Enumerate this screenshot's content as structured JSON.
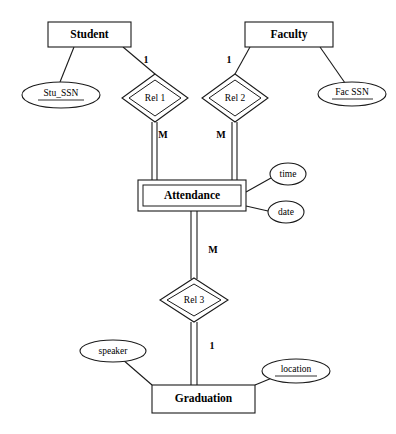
{
  "diagram": {
    "type": "entity-relationship-diagram",
    "notation": "Chen",
    "entities": [
      {
        "id": "student",
        "label": "Student",
        "kind": "strong",
        "x": 48,
        "y": 22,
        "w": 83,
        "h": 25
      },
      {
        "id": "faculty",
        "label": "Faculty",
        "kind": "strong",
        "x": 245,
        "y": 22,
        "w": 88,
        "h": 25
      },
      {
        "id": "attendance",
        "label": "Attendance",
        "kind": "weak",
        "x": 138,
        "y": 180,
        "w": 108,
        "h": 31
      },
      {
        "id": "graduation",
        "label": "Graduation",
        "kind": "strong",
        "x": 152,
        "y": 385,
        "w": 103,
        "h": 28
      }
    ],
    "relationships": [
      {
        "id": "rel1",
        "label": "Rel 1",
        "kind": "identifying",
        "cx": 155,
        "cy": 98,
        "rx": 33,
        "ry": 24
      },
      {
        "id": "rel2",
        "label": "Rel 2",
        "kind": "identifying",
        "cx": 235,
        "cy": 98,
        "rx": 33,
        "ry": 24
      },
      {
        "id": "rel3",
        "label": "Rel 3",
        "kind": "identifying",
        "cx": 194,
        "cy": 300,
        "rx": 34,
        "ry": 22
      }
    ],
    "attributes": [
      {
        "id": "stu_ssn",
        "label": "Stu_SSN",
        "key": true,
        "cx": 61,
        "cy": 95,
        "rx": 39,
        "ry": 13
      },
      {
        "id": "fac_ssn",
        "label": "Fac SSN",
        "key": true,
        "cx": 352,
        "cy": 94,
        "rx": 34,
        "ry": 12
      },
      {
        "id": "time",
        "label": "time",
        "key": false,
        "cx": 288,
        "cy": 174,
        "rx": 18,
        "ry": 11
      },
      {
        "id": "date",
        "label": "date",
        "key": false,
        "cx": 286,
        "cy": 212,
        "rx": 18,
        "ry": 11
      },
      {
        "id": "speaker",
        "label": "speaker",
        "key": false,
        "cx": 113,
        "cy": 351,
        "rx": 33,
        "ry": 11
      },
      {
        "id": "location",
        "label": "location",
        "key": true,
        "cx": 296,
        "cy": 371,
        "rx": 34,
        "ry": 12
      }
    ],
    "cardinalities": [
      {
        "id": "card-student-rel1",
        "label": "1",
        "x": 146,
        "y": 61
      },
      {
        "id": "card-faculty-rel2",
        "label": "1",
        "x": 229,
        "y": 61
      },
      {
        "id": "card-rel1-attendance",
        "label": "M",
        "x": 163,
        "y": 136
      },
      {
        "id": "card-rel2-attendance",
        "label": "M",
        "x": 221,
        "y": 136
      },
      {
        "id": "card-attendance-rel3",
        "label": "M",
        "x": 213,
        "y": 251
      },
      {
        "id": "card-rel3-graduation",
        "label": "1",
        "x": 212,
        "y": 347
      }
    ],
    "connectors": [
      {
        "id": "conn-student-stu_ssn",
        "kind": "single"
      },
      {
        "id": "conn-student-rel1",
        "kind": "single"
      },
      {
        "id": "conn-faculty-rel2",
        "kind": "single"
      },
      {
        "id": "conn-faculty-fac_ssn",
        "kind": "single"
      },
      {
        "id": "conn-rel1-attendance",
        "kind": "double"
      },
      {
        "id": "conn-rel2-attendance",
        "kind": "double"
      },
      {
        "id": "conn-attendance-time",
        "kind": "single"
      },
      {
        "id": "conn-attendance-date",
        "kind": "single"
      },
      {
        "id": "conn-attendance-rel3",
        "kind": "double"
      },
      {
        "id": "conn-rel3-graduation",
        "kind": "double"
      },
      {
        "id": "conn-graduation-speaker",
        "kind": "single"
      },
      {
        "id": "conn-graduation-location",
        "kind": "single"
      }
    ]
  }
}
